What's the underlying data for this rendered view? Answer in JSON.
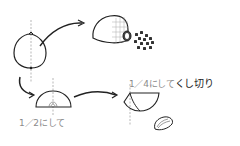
{
  "diagram": {
    "type": "cooking-illustration",
    "labels": {
      "half": "1／2にして",
      "quarter_prefix": "1／4にして",
      "quarter_suffix": "くし切り"
    },
    "steps": [
      {
        "id": "whole-onion",
        "description": "whole onion with vertical center line"
      },
      {
        "id": "minced",
        "description": "half onion cross-hatched and diced pieces"
      },
      {
        "id": "halved",
        "description": "onion cut in half"
      },
      {
        "id": "wedges",
        "description": "quarter onion cut into wedges"
      }
    ],
    "colors": {
      "stroke": "#222222",
      "guide": "#9a9a9a",
      "label": "#8a8a8a"
    }
  }
}
